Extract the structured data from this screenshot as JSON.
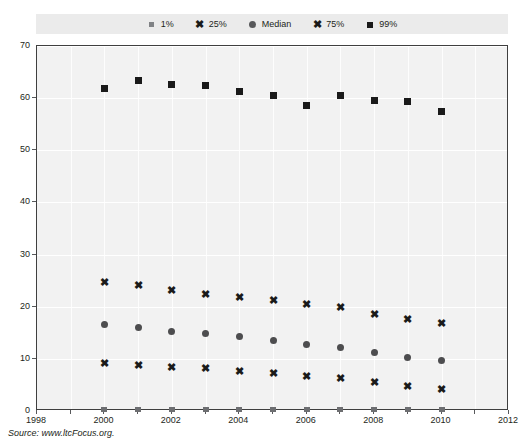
{
  "title": "",
  "source_note": "Source: www.ltcFocus.org.",
  "legend": {
    "position": "top",
    "background": "#ebebeb",
    "entries": [
      {
        "label": "1%",
        "marker": "small-gray-square-icon",
        "color": "#808285"
      },
      {
        "label": "25%",
        "marker": "x-mark-icon",
        "color": "#1a1a1a"
      },
      {
        "label": "Median",
        "marker": "gray-circle-icon",
        "color": "#58595b"
      },
      {
        "label": "75%",
        "marker": "x-mark-icon",
        "color": "#1a1a1a"
      },
      {
        "label": "99%",
        "marker": "black-square-icon",
        "color": "#1a1a1a"
      }
    ]
  },
  "axes": {
    "y_ticks": [
      0,
      10,
      20,
      30,
      40,
      50,
      60,
      70
    ],
    "x_ticks": [
      1998,
      2000,
      2002,
      2004,
      2006,
      2008,
      2010,
      2012
    ]
  },
  "chart_data": {
    "type": "scatter",
    "title": "",
    "xlabel": "",
    "ylabel": "",
    "xlim": [
      1998,
      2012
    ],
    "ylim": [
      0,
      70
    ],
    "grid": true,
    "legend_position": "top",
    "x": [
      2000,
      2001,
      2002,
      2003,
      2004,
      2005,
      2006,
      2007,
      2008,
      2009,
      2010
    ],
    "series": [
      {
        "name": "99%",
        "marker": "black-square-icon",
        "color": "#1a1a1a",
        "values": [
          61.8,
          63.4,
          62.6,
          62.4,
          61.2,
          60.6,
          58.6,
          60.6,
          59.6,
          59.3,
          57.5
        ]
      },
      {
        "name": "75%",
        "marker": "x-mark-icon",
        "color": "#1a1a1a",
        "values": [
          24.7,
          24.0,
          23.1,
          22.4,
          21.8,
          21.1,
          20.4,
          19.8,
          18.6,
          17.5,
          16.8
        ]
      },
      {
        "name": "Median",
        "marker": "gray-circle-icon",
        "color": "#4d4d4f",
        "values": [
          16.5,
          16.0,
          15.3,
          14.9,
          14.3,
          13.5,
          12.8,
          12.1,
          11.2,
          10.2,
          9.7
        ]
      },
      {
        "name": "25%",
        "marker": "x-mark-icon",
        "color": "#1a1a1a",
        "values": [
          9.2,
          8.8,
          8.4,
          8.2,
          7.6,
          7.2,
          6.6,
          6.3,
          5.4,
          4.7,
          4.2
        ]
      },
      {
        "name": "1%",
        "marker": "small-gray-square-icon",
        "color": "#6d6e71",
        "values": [
          0.2,
          0.2,
          0.2,
          0.2,
          0.2,
          0.2,
          0.2,
          0.2,
          0.2,
          0.2,
          0.2
        ]
      }
    ]
  }
}
